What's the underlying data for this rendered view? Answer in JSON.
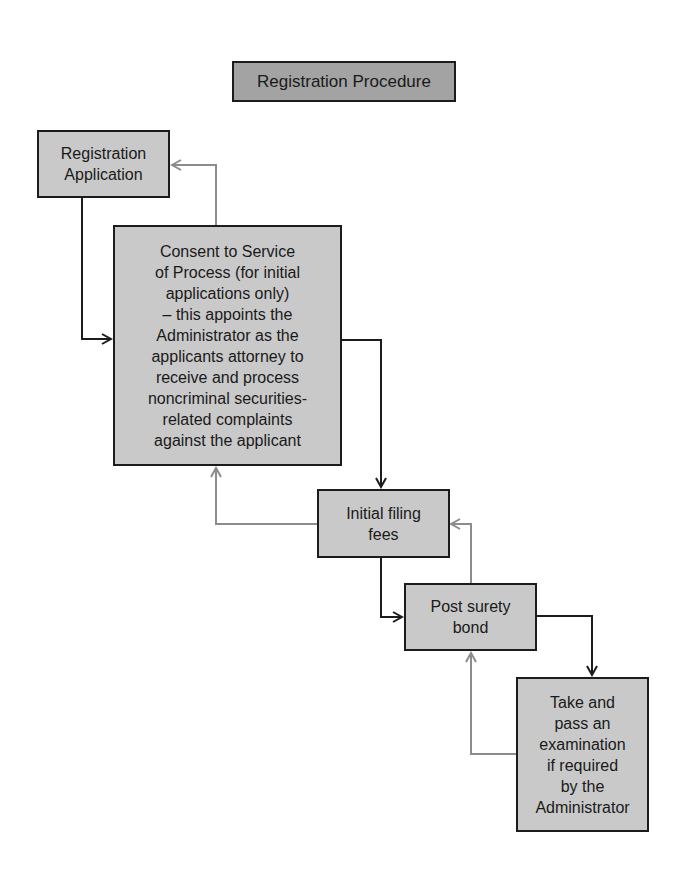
{
  "title": "Registration Procedure",
  "steps": [
    {
      "id": "registration-application",
      "label": "Registration\nApplication"
    },
    {
      "id": "consent-to-service",
      "label": "Consent to Service\nof Process (for initial\napplications only)\n– this appoints the\nAdministrator as the\napplicants attorney to\nreceive and process\nnoncriminal securities-\nrelated complaints\nagainst the applicant"
    },
    {
      "id": "initial-filing-fees",
      "label": "Initial filing\nfees"
    },
    {
      "id": "post-surety-bond",
      "label": "Post surety\nbond"
    },
    {
      "id": "take-examination",
      "label": "Take and\npass an\nexamination\nif required\nby the\nAdministrator"
    }
  ],
  "colors": {
    "forward_arrow": "#1c1c1c",
    "back_arrow": "#8c8c8c",
    "box_fill": "#c9c9c9",
    "title_fill": "#a3a3a3"
  }
}
